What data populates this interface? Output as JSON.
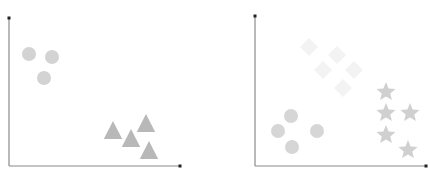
{
  "chart_data": [
    {
      "type": "scatter",
      "title": "",
      "xlabel": "",
      "ylabel": "",
      "grid": false,
      "legend": null,
      "axes": {
        "origin": [
          9,
          166
        ],
        "x_end": [
          180,
          166
        ],
        "y_end": [
          9,
          18
        ],
        "axis_color": "#8a8a8a",
        "tick_color": "#222222"
      },
      "series": [
        {
          "name": "circles",
          "marker": "circle",
          "color": "#d3d3d3",
          "radius": 7,
          "points": [
            [
              29,
              54
            ],
            [
              52,
              57
            ],
            [
              44,
              78
            ]
          ]
        },
        {
          "name": "triangles",
          "marker": "triangle",
          "color": "#b8b8b8",
          "size": 16,
          "points": [
            [
              113,
              131
            ],
            [
              131,
              139
            ],
            [
              146,
              124
            ],
            [
              149,
              151
            ]
          ]
        }
      ]
    },
    {
      "type": "scatter",
      "title": "",
      "xlabel": "",
      "ylabel": "",
      "grid": false,
      "legend": null,
      "axes": {
        "origin": [
          255,
          166
        ],
        "x_end": [
          426,
          166
        ],
        "y_end": [
          255,
          16
        ],
        "axis_color": "#8a8a8a",
        "tick_color": "#222222"
      },
      "series": [
        {
          "name": "diamonds",
          "marker": "diamond",
          "color": "#f3f3f3",
          "size": 14,
          "points": [
            [
              309,
              47
            ],
            [
              337,
              55
            ],
            [
              323,
              70
            ],
            [
              354,
              70
            ],
            [
              343,
              88
            ]
          ]
        },
        {
          "name": "circles",
          "marker": "circle",
          "color": "#d6d6d6",
          "radius": 7,
          "points": [
            [
              291,
              116
            ],
            [
              278,
              131
            ],
            [
              317,
              131
            ],
            [
              292,
              147
            ]
          ]
        },
        {
          "name": "stars",
          "marker": "star",
          "color": "#d0d0d0",
          "size": 10,
          "points": [
            [
              386,
              92
            ],
            [
              386,
              113
            ],
            [
              410,
              113
            ],
            [
              386,
              135
            ],
            [
              408,
              150
            ]
          ]
        }
      ]
    }
  ]
}
